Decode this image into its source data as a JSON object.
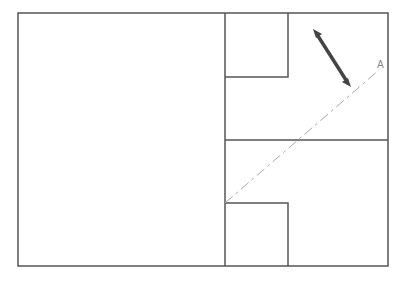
{
  "diagram": {
    "label_a": "A",
    "colors": {
      "line": "#555555",
      "dash": "#aaaaaa",
      "arrow": "#444444",
      "label": "#888888"
    }
  }
}
